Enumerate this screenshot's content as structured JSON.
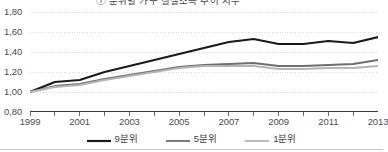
{
  "title": {
    "text": "① 분위별 가구 실질소득 추이 지수",
    "clipped": true
  },
  "chart_data": {
    "type": "line",
    "title": "① 분위별 가구 실질소득 추이 지수",
    "xlabel": "",
    "ylabel": "",
    "x": [
      1999,
      2000,
      2001,
      2002,
      2003,
      2004,
      2005,
      2006,
      2007,
      2008,
      2009,
      2010,
      2011,
      2012,
      2013
    ],
    "tick_labels_x": [
      "1999",
      "2001",
      "2003",
      "2005",
      "2007",
      "2009",
      "2011",
      "2013"
    ],
    "tick_labels_y": [
      "0,80",
      "1,00",
      "1,20",
      "1,40",
      "1,60",
      "1,80"
    ],
    "ylim": [
      0.8,
      1.8
    ],
    "ytick_step": 0.2,
    "xlim": [
      1999,
      2013
    ],
    "grid": true,
    "grid_style": "dotted-horizontal",
    "legend_position": "bottom-center",
    "decimal_separator": ",",
    "series": [
      {
        "name": "9분위",
        "color": "#1a1a1a",
        "width": 2.2,
        "values": [
          1.0,
          1.1,
          1.12,
          1.2,
          1.26,
          1.32,
          1.38,
          1.44,
          1.5,
          1.53,
          1.48,
          1.48,
          1.51,
          1.49,
          1.55
        ]
      },
      {
        "name": "5분위",
        "color": "#6e6e6e",
        "width": 1.8,
        "values": [
          1.0,
          1.06,
          1.08,
          1.13,
          1.17,
          1.21,
          1.25,
          1.27,
          1.28,
          1.29,
          1.26,
          1.26,
          1.27,
          1.28,
          1.32
        ]
      },
      {
        "name": "1분위",
        "color": "#b4b4b4",
        "width": 1.8,
        "values": [
          1.0,
          1.05,
          1.07,
          1.12,
          1.16,
          1.2,
          1.24,
          1.26,
          1.26,
          1.26,
          1.23,
          1.23,
          1.24,
          1.24,
          1.26
        ]
      }
    ]
  },
  "axis": {
    "ylabels": [
      "1,80",
      "1,60",
      "1,40",
      "1,20",
      "1,00",
      "0,80"
    ],
    "xlabels": [
      "1999",
      "2001",
      "2003",
      "2005",
      "2007",
      "2009",
      "2011",
      "2013"
    ]
  },
  "legend": {
    "items": [
      {
        "label": "9분위",
        "color": "#1a1a1a"
      },
      {
        "label": "5분위",
        "color": "#6e6e6e"
      },
      {
        "label": "1분위",
        "color": "#b4b4b4"
      }
    ]
  },
  "colors": {
    "grid": "#d9d9d9",
    "axis": "#3a3a3a",
    "text": "#4d4d4d",
    "background": "#ffffff"
  }
}
